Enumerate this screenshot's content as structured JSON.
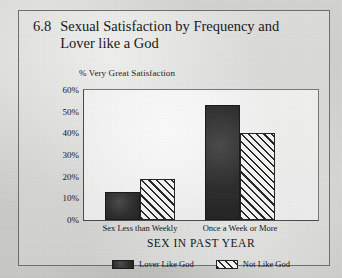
{
  "figure": {
    "number": "6.8",
    "title": "Sexual Satisfaction by Frequency and Lover like a God"
  },
  "chart_data": {
    "type": "bar",
    "title": "Sexual Satisfaction by Frequency and Lover like a God",
    "subtitle": "% Very Great Satisfaction",
    "xlabel": "SEX IN PAST YEAR",
    "ylabel": "% Very Great Satisfaction",
    "categories": [
      "Sex Less than Weekly",
      "Once a Week or More"
    ],
    "series": [
      {
        "name": "Lover Like God",
        "values": [
          13,
          53
        ],
        "fill": "solid",
        "color": "#2e2e2e"
      },
      {
        "name": "Not Like God",
        "values": [
          19,
          40
        ],
        "fill": "hatched",
        "color": "#2a2a2a"
      }
    ],
    "ylim": [
      0,
      60
    ],
    "ytick_labels": [
      "60%",
      "50%",
      "40%",
      "30%",
      "20%",
      "10%",
      "0%"
    ],
    "ytick_values": [
      60,
      50,
      40,
      30,
      20,
      10,
      0
    ],
    "grid": false,
    "legend_position": "bottom"
  }
}
